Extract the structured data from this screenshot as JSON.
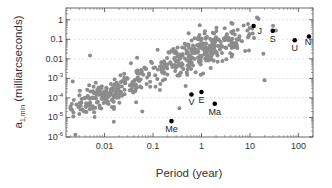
{
  "chart_data": {
    "type": "scatter",
    "title": "",
    "xlabel": "Period (year)",
    "ylabel": "a1,min (milliarcseconds)",
    "ylabel_main": "a",
    "ylabel_sub": "1,min",
    "ylabel_rest": " (milliarcseconds)",
    "xscale": "log",
    "yscale": "log",
    "xlim": [
      0.0016,
      200
    ],
    "ylim": [
      1e-06,
      4
    ],
    "grid": "dotted horizontal at each decade",
    "x_ticks": [
      {
        "value": 0.01,
        "label": "0.01"
      },
      {
        "value": 0.1,
        "label": "0.1"
      },
      {
        "value": 1,
        "label": "1"
      },
      {
        "value": 10,
        "label": "10"
      },
      {
        "value": 100,
        "label": "100"
      }
    ],
    "y_ticks": [
      {
        "value": 1,
        "label": "1",
        "exp": ""
      },
      {
        "value": 0.1,
        "label": "0.1",
        "exp": ""
      },
      {
        "value": 0.01,
        "label": "0.01",
        "exp": ""
      },
      {
        "value": 0.001,
        "label": "10",
        "exp": "-3"
      },
      {
        "value": 0.0001,
        "label": "10",
        "exp": "-4"
      },
      {
        "value": 1e-05,
        "label": "10",
        "exp": "-5"
      },
      {
        "value": 1e-06,
        "label": "10",
        "exp": "-6"
      }
    ],
    "series": [
      {
        "name": "Exoplanets",
        "color": "#8c8c8c",
        "points_note": "approximate distribution: dense cluster near P~0.005-0.02 yr, a~1e-4 mao; broad band rising to P~1-10 yr, a~0.01-0.5",
        "cluster_centers": [
          {
            "x": 0.008,
            "y": 0.0001,
            "spread_x": 0.25,
            "spread_y": 0.35,
            "n": 140
          },
          {
            "x": 0.05,
            "y": 0.001,
            "spread_x": 0.35,
            "spread_y": 0.5,
            "n": 80
          },
          {
            "x": 1.5,
            "y": 0.03,
            "spread_x": 0.35,
            "spread_y": 0.45,
            "n": 200
          },
          {
            "x": 0.4,
            "y": 0.01,
            "spread_x": 0.3,
            "spread_y": 0.5,
            "n": 60
          }
        ],
        "outliers": [
          {
            "x": 0.0025,
            "y": 1.3e-06
          },
          {
            "x": 0.002,
            "y": 3e-05
          },
          {
            "x": 0.0022,
            "y": 0.0007
          },
          {
            "x": 0.005,
            "y": 0.015
          },
          {
            "x": 0.035,
            "y": 0.006
          },
          {
            "x": 0.0155,
            "y": 6e-06
          },
          {
            "x": 0.45,
            "y": 0.06
          },
          {
            "x": 20,
            "y": 0.0008
          },
          {
            "x": 30,
            "y": 0.5
          },
          {
            "x": 14,
            "y": 1.3
          },
          {
            "x": 0.28,
            "y": 0.02
          },
          {
            "x": 0.06,
            "y": 2e-05
          },
          {
            "x": 0.35,
            "y": 3e-05
          }
        ]
      },
      {
        "name": "Solar System",
        "color": "#000000",
        "points": [
          {
            "label": "Me",
            "x": 0.24,
            "y": 6.5e-06
          },
          {
            "label": "V",
            "x": 0.62,
            "y": 0.00015
          },
          {
            "label": "E",
            "x": 1.0,
            "y": 0.0002
          },
          {
            "label": "Ma",
            "x": 1.88,
            "y": 5e-05
          },
          {
            "label": "J",
            "x": 11.9,
            "y": 0.48
          },
          {
            "label": "S",
            "x": 29.5,
            "y": 0.27
          },
          {
            "label": "U",
            "x": 84,
            "y": 0.09
          },
          {
            "label": "N",
            "x": 165,
            "y": 0.14
          }
        ]
      }
    ]
  }
}
